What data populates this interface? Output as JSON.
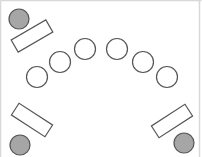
{
  "diagram": {
    "type": "seating-arrangement",
    "width": 202,
    "height": 157,
    "colors": {
      "background": "#ffffff",
      "frame": "#d8d8d8",
      "outline": "#555555",
      "filled_seat": "#a6a6a6",
      "empty_seat": "#ffffff"
    },
    "corner_stations": [
      {
        "id": "top-left",
        "seat": {
          "cx": 19,
          "cy": 19,
          "r": 10
        },
        "desk": {
          "cx": 32,
          "cy": 36,
          "w": 40,
          "h": 14,
          "angle": -30
        }
      },
      {
        "id": "bottom-left",
        "seat": {
          "cx": 20,
          "cy": 145,
          "r": 10
        },
        "desk": {
          "cx": 32,
          "cy": 120,
          "w": 40,
          "h": 14,
          "angle": 33
        }
      },
      {
        "id": "bottom-right",
        "seat": {
          "cx": 184,
          "cy": 143,
          "r": 10
        },
        "desk": {
          "cx": 172,
          "cy": 121,
          "w": 40,
          "h": 14,
          "angle": -33
        }
      }
    ],
    "arc_seats": [
      {
        "cx": 37,
        "cy": 77,
        "r": 10.5
      },
      {
        "cx": 60,
        "cy": 62,
        "r": 10.5
      },
      {
        "cx": 85,
        "cy": 49,
        "r": 10.5
      },
      {
        "cx": 117,
        "cy": 49,
        "r": 10.5
      },
      {
        "cx": 143,
        "cy": 62,
        "r": 10.5
      },
      {
        "cx": 167,
        "cy": 77,
        "r": 10.5
      }
    ]
  }
}
